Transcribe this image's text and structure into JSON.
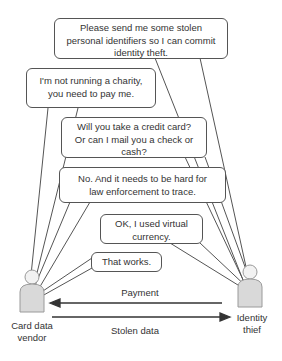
{
  "diagram": {
    "actors": {
      "vendor": {
        "label_line1": "Card data",
        "label_line2": "vendor",
        "icon": "person-icon"
      },
      "thief": {
        "label_line1": "Identity",
        "label_line2": "thief",
        "icon": "person-icon"
      }
    },
    "messages": [
      {
        "speaker": "thief",
        "line1": "Please send me some stolen",
        "line2": "personal identifiers so I can commit",
        "line3": "identity theft."
      },
      {
        "speaker": "vendor",
        "line1": "I'm not running a charity,",
        "line2": "you need to pay me."
      },
      {
        "speaker": "thief",
        "line1": "Will you take a credit card?",
        "line2": "Or can I mail you a check or",
        "line3": "cash?"
      },
      {
        "speaker": "vendor",
        "line1": "No. And it needs to be hard for",
        "line2": "law enforcement to trace."
      },
      {
        "speaker": "thief",
        "line1": "OK, I used virtual",
        "line2": "currency."
      },
      {
        "speaker": "vendor",
        "line1": "That works."
      }
    ],
    "arrows": {
      "payment": {
        "label": "Payment",
        "direction": "thief-to-vendor"
      },
      "stolen_data": {
        "label": "Stolen data",
        "direction": "vendor-to-thief"
      }
    },
    "colors": {
      "line": "#555555",
      "person_fill": "#d9d9d9",
      "person_stroke": "#9a9a9a"
    }
  }
}
